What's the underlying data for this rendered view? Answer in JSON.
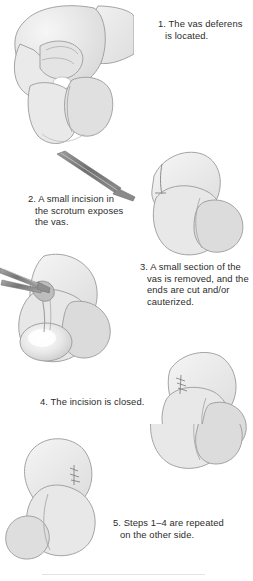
{
  "figure": {
    "background_color": "#ffffff",
    "text_color": "#2b2b2b",
    "line_color": "#8c8c8c",
    "fill_light": "#ebebeb",
    "fill_mid": "#e0e0e0",
    "fill_shadow": "#d2d2d2",
    "instrument_color": "#7a7a7a",
    "instrument_light": "#b5b5b5"
  },
  "steps": [
    {
      "number": "1",
      "caption": "1. The vas deferens\n is located.",
      "illustration_name": "hand-grasping-scrotum-illustration",
      "illustration_alt": "A hand grasps the scrotum to isolate the vas deferens"
    },
    {
      "number": "2",
      "caption": "2. A small incision in\n the scrotum exposes\n the vas.",
      "illustration_name": "scalpel-incision-illustration",
      "illustration_alt": "A scalpel makes a small incision in the scrotum"
    },
    {
      "number": "3",
      "caption": "3. A small section of the\n vas is removed, and the\n ends are cut and/or\n cauterized.",
      "illustration_name": "forceps-vas-removal-illustration",
      "illustration_alt": "Forceps lift the vas deferens through the incision for removal"
    },
    {
      "number": "4",
      "caption": "4. The incision is closed.",
      "illustration_name": "closed-incision-illustration",
      "illustration_alt": "The scrotal incision is closed with sutures"
    },
    {
      "number": "5",
      "caption": "5. Steps 1–4 are repeated\n on the other side.",
      "illustration_name": "opposite-side-illustration",
      "illustration_alt": "The sutured scrotum shown from the opposite side"
    }
  ],
  "footer": {
    "rule_visible": true
  }
}
